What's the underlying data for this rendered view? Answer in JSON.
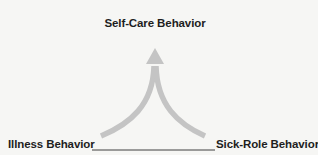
{
  "diagram": {
    "top_node": {
      "label": "Self-Care Behavior"
    },
    "left_node": {
      "label": "Illness Behavior"
    },
    "right_node": {
      "label": "Sick-Role Behavior"
    },
    "arrow": {
      "description": "Two curved gray arrows merging from the bottom-left and bottom-right into a single upward arrowhead pointing at the top node",
      "color": "#c4c4c4"
    },
    "baseline": {
      "description": "Thin dark horizontal line connecting the two bottom nodes",
      "color": "#2a2a2a"
    },
    "background_color": "#f6f6f4"
  }
}
